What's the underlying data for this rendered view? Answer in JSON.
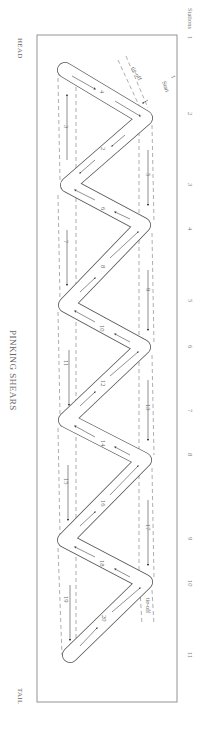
{
  "title": "PINKING SHEARS",
  "ends": {
    "head": "HEAD",
    "tail": "TAIL"
  },
  "stations": {
    "label": "Stations",
    "items": [
      {
        "n": "1",
        "y": 26
      },
      {
        "n": "2",
        "y": 115
      },
      {
        "n": "3",
        "y": 186
      },
      {
        "n": "4",
        "y": 230
      },
      {
        "n": "5",
        "y": 302
      },
      {
        "n": "6",
        "y": 348
      },
      {
        "n": "7",
        "y": 412
      },
      {
        "n": "8",
        "y": 456
      },
      {
        "n": "9",
        "y": 540
      },
      {
        "n": "10",
        "y": 583
      },
      {
        "n": "11",
        "y": 655
      }
    ]
  },
  "annotations": {
    "start": "Start",
    "start_number": "1",
    "tie_off_top": "tie-off",
    "tie_off_bottom": "tie-off"
  },
  "segments": [
    {
      "n": "2",
      "kind": "solid"
    },
    {
      "n": "3",
      "kind": "dashed"
    },
    {
      "n": "4",
      "kind": "solid"
    },
    {
      "n": "5",
      "kind": "dashed"
    },
    {
      "n": "6",
      "kind": "solid"
    },
    {
      "n": "7",
      "kind": "dashed"
    },
    {
      "n": "8",
      "kind": "solid"
    },
    {
      "n": "9",
      "kind": "dashed"
    },
    {
      "n": "10",
      "kind": "solid"
    },
    {
      "n": "11",
      "kind": "dashed"
    },
    {
      "n": "12",
      "kind": "solid"
    },
    {
      "n": "13",
      "kind": "dashed"
    },
    {
      "n": "14",
      "kind": "solid"
    },
    {
      "n": "15",
      "kind": "dashed"
    },
    {
      "n": "16",
      "kind": "solid"
    },
    {
      "n": "17",
      "kind": "dashed"
    },
    {
      "n": "18",
      "kind": "solid"
    },
    {
      "n": "19",
      "kind": "dashed"
    },
    {
      "n": "20",
      "kind": "solid"
    }
  ],
  "colors": {
    "line": "#555555",
    "frame": "#777777",
    "text": "#666666"
  }
}
